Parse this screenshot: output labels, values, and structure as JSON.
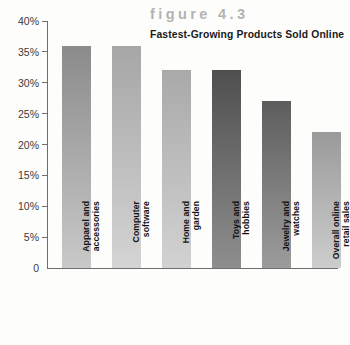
{
  "figure": {
    "number_label": "figure 4.3",
    "caption": "Fastest-Growing Products Sold Online"
  },
  "axis": {
    "y_tick_labels": [
      "40%",
      "35%",
      "30%",
      "25%",
      "20%",
      "15%",
      "10%",
      "5%",
      "0"
    ],
    "zero_label": "0"
  },
  "colors": {
    "figure_number": "#b3b3b3",
    "caption": "#1a1a1a",
    "axis_line": "#6f6f6f",
    "tick_label": "#3a3a3a",
    "background": "#fdfdfc"
  },
  "chart_data": {
    "type": "bar",
    "title": "figure 4.3",
    "subtitle": "Fastest-Growing Products Sold Online",
    "xlabel": "",
    "ylabel": "",
    "ylim": [
      0,
      40
    ],
    "ytick_values": [
      40,
      35,
      30,
      25,
      20,
      15,
      10,
      5,
      0
    ],
    "ytick_labels": [
      "40%",
      "35%",
      "30%",
      "25%",
      "20%",
      "15%",
      "10%",
      "5%",
      "0"
    ],
    "grid": false,
    "legend": false,
    "units": "percent",
    "categories": [
      "Apparel and\naccessories",
      "Computer\nsoftware",
      "Home and\ngarden",
      "Toys and\nhobbies",
      "Jewelry and\nwatches",
      "Overall online\nretail sales"
    ],
    "values": [
      36,
      36,
      32,
      32,
      27,
      22
    ],
    "bar_colors_top": [
      "#8b8b8b",
      "#a6a6a6",
      "#a9a9a9",
      "#4f4f4f",
      "#5d5d5d",
      "#9a9a9a"
    ],
    "bar_colors_bottom": [
      "#c9c9c9",
      "#d4d4d4",
      "#d2d2d2",
      "#8e8e8e",
      "#9c9c9c",
      "#cdcdcd"
    ]
  }
}
